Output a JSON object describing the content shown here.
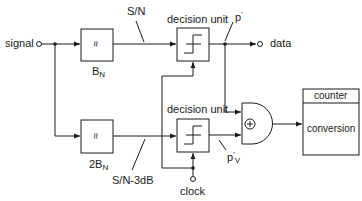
{
  "diagram": {
    "type": "block-diagram",
    "input": {
      "label": "signal"
    },
    "output": {
      "label": "data"
    },
    "clock": {
      "label": "clock"
    },
    "filters": [
      {
        "id": "filter-top",
        "symbol": "≈",
        "bandwidth_main": "B",
        "bandwidth_sub": "N"
      },
      {
        "id": "filter-bottom",
        "symbol": "≈",
        "bandwidth_main": "2B",
        "bandwidth_sub": "N"
      }
    ],
    "signal_labels": {
      "top_snr": "S/N",
      "bottom_snr": "S/N-3dB",
      "p_prime": "p",
      "p_prime_mark": "'",
      "pv_main": "p",
      "pv_mark": "'",
      "pv_sub": "V"
    },
    "decision_units": [
      {
        "id": "decision-unit-top",
        "label": "decision unit"
      },
      {
        "id": "decision-unit-bottom",
        "label": "decision unit"
      }
    ],
    "gate": {
      "symbol": "⊕",
      "type": "xor-gate"
    },
    "counter_box": {
      "header": "counter",
      "body": "conversion"
    },
    "colors": {
      "line": "#1a1a1a",
      "background": "#ffffff"
    }
  }
}
